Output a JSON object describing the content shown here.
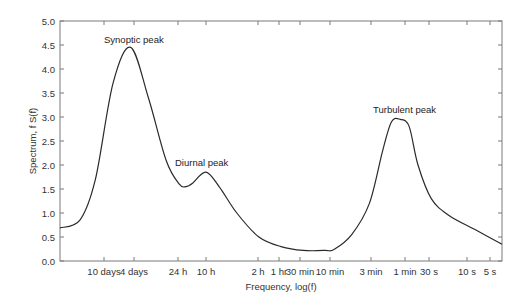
{
  "chart_data": {
    "type": "line",
    "title": "",
    "xlabel": "Frequency, log(f)",
    "ylabel": "Spectrum, f S(f)",
    "ylim": [
      0.0,
      5.0
    ],
    "y_ticks": [
      "0.0",
      "0.5",
      "1.0",
      "1.5",
      "2.0",
      "2.5",
      "3.0",
      "3.5",
      "4.0",
      "4.5",
      "5.0"
    ],
    "x_ticks": [
      "10 days",
      "4 days",
      "24 h",
      "10 h",
      "2 h",
      "1 hr",
      "30 min",
      "10 min",
      "3 min",
      "1 min",
      "30 s",
      "10 s",
      "5 s"
    ],
    "grid": false,
    "legend": null,
    "annotations": [
      {
        "text": "Synoptic peak",
        "near": "4 days",
        "value": 4.45
      },
      {
        "text": "Diurnal peak",
        "near": "24 h - 10 h",
        "value": 1.85
      },
      {
        "text": "Turbulent peak",
        "near": "1 min",
        "value": 2.95
      }
    ],
    "series": [
      {
        "name": "Spectrum",
        "x_position_fraction": [
          0.0,
          0.045,
          0.08,
          0.12,
          0.16,
          0.2,
          0.24,
          0.27,
          0.285,
          0.3,
          0.33,
          0.36,
          0.4,
          0.45,
          0.5,
          0.55,
          0.6,
          0.62,
          0.66,
          0.7,
          0.73,
          0.75,
          0.77,
          0.79,
          0.81,
          0.84,
          0.88,
          0.94,
          1.0
        ],
        "values": [
          0.69,
          0.85,
          1.7,
          3.7,
          4.45,
          3.4,
          2.1,
          1.6,
          1.55,
          1.62,
          1.85,
          1.55,
          1.0,
          0.5,
          0.3,
          0.22,
          0.22,
          0.24,
          0.55,
          1.2,
          2.3,
          2.9,
          2.95,
          2.8,
          2.0,
          1.3,
          0.95,
          0.65,
          0.35
        ]
      }
    ]
  },
  "labels": {
    "ylabel": "Spectrum, f S(f)",
    "xlabel": "Frequency, log(f)",
    "synoptic": "Synoptic peak",
    "diurnal": "Diurnal peak",
    "turbulent": "Turbulent peak"
  }
}
